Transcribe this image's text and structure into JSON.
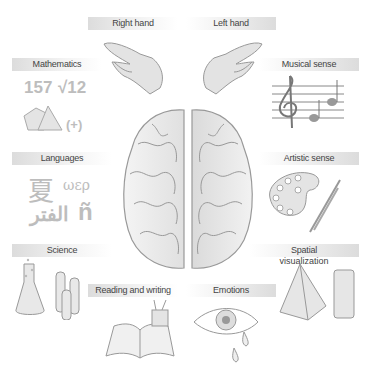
{
  "left_hemisphere_functions": [
    {
      "id": "right-hand",
      "label": "Right hand"
    },
    {
      "id": "mathematics",
      "label": "Mathematics"
    },
    {
      "id": "languages",
      "label": "Languages"
    },
    {
      "id": "science",
      "label": "Science"
    },
    {
      "id": "reading-writing",
      "label": "Reading and writing"
    }
  ],
  "right_hemisphere_functions": [
    {
      "id": "left-hand",
      "label": "Left hand"
    },
    {
      "id": "musical-sense",
      "label": "Musical sense"
    },
    {
      "id": "artistic-sense",
      "label": "Artistic sense"
    },
    {
      "id": "spatial-visualization",
      "label": "Spatial visualization"
    },
    {
      "id": "emotions",
      "label": "Emotions"
    }
  ],
  "labels": {
    "right_hand": "Right hand",
    "left_hand": "Left hand",
    "mathematics": "Mathematics",
    "musical_sense": "Musical sense",
    "languages": "Languages",
    "artistic_sense": "Artistic sense",
    "science": "Science",
    "spatial_line1": "Spatial",
    "spatial_line2": "visualization",
    "reading_writing": "Reading and writing",
    "emotions": "Emotions"
  },
  "glyphs": {
    "math_number": "157",
    "math_root": "√12",
    "math_plus": "(+)",
    "lang_chinese": "夏",
    "lang_greek": "ωερ",
    "lang_arabic": "الفتر",
    "lang_spanish": "ñ"
  },
  "colors": {
    "label_dark": "#dcdcdc",
    "label_light": "#ffffff",
    "text": "#444444",
    "art": "#9a9a9a",
    "art_fill": "#e6e6e6"
  }
}
